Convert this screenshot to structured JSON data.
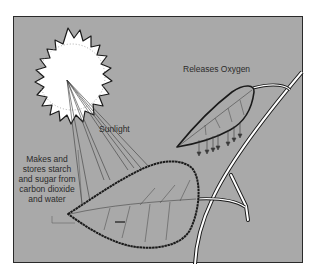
{
  "diagram": {
    "labels": {
      "sunlight": "Sunlight",
      "oxygen": "Releases Oxygen",
      "makes_stores": [
        "Makes and",
        "stores starch",
        "and sugar from",
        "carbon dioxide",
        "and water"
      ]
    },
    "elements": [
      "sun",
      "light-rays",
      "upper-leaf",
      "lower-leaf",
      "branch",
      "oxygen-arrows"
    ],
    "colors": {
      "background": "#a9a9a9",
      "frame_border": "#2a2a2a",
      "sun": "#ffffff",
      "outline": "#1a1a1a",
      "text": "#2b2b2b"
    }
  }
}
